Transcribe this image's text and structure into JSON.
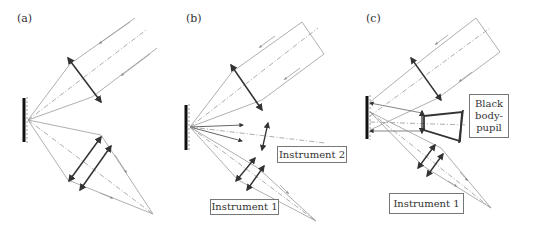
{
  "panels": [
    {
      "id": "a",
      "label": "(a)"
    },
    {
      "id": "b",
      "label": "(b)",
      "boxes": [
        "Instrument 2",
        "Instrument 1"
      ]
    },
    {
      "id": "c",
      "label": "(c)",
      "boxes": [
        "Black body-pupil",
        "Instrument 1"
      ]
    }
  ],
  "labels": {
    "a": "(a)",
    "b": "(b)",
    "c": "(c)",
    "b_instrument2": "Instrument 2",
    "b_instrument1": "Instrument 1",
    "c_blackbody_line1": "Black",
    "c_blackbody_line2": "body-",
    "c_blackbody_line3": "pupil",
    "c_instrument1": "Instrument 1"
  },
  "colors": {
    "ray": "#9a9a9a",
    "lens": "#333333",
    "mirror": "#111111",
    "axis": "#777777"
  }
}
